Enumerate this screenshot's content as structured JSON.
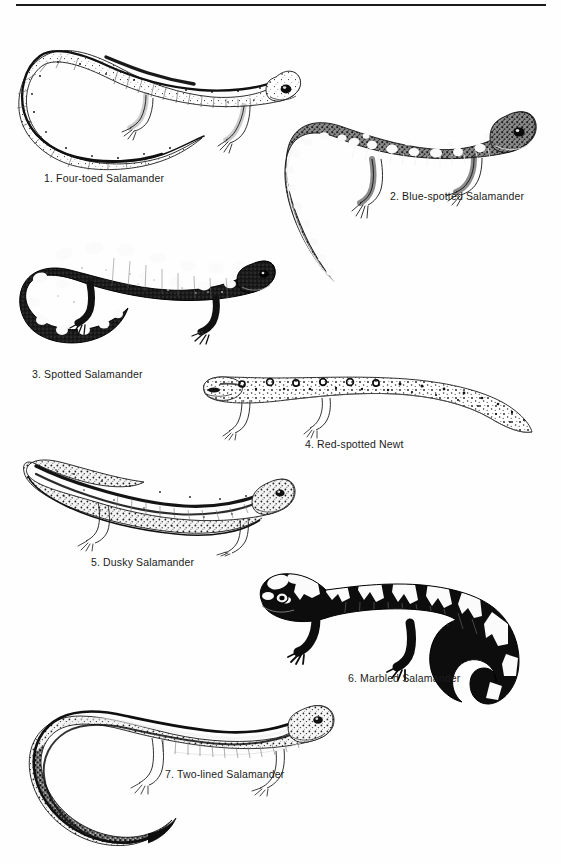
{
  "page": {
    "background_color": "#fefefe",
    "ink_color": "#1a1a1a",
    "width": 561,
    "height": 864,
    "rule": {
      "name": "top-rule",
      "color": "#1a1a1a"
    }
  },
  "plate": {
    "style": "black-and-white stipple and line engraving",
    "figures": [
      {
        "number": "1",
        "caption": "1. Four-toed Salamander",
        "common_name": "Four-toed Salamander",
        "pose": "body arched with long tail curving down and to the left, head at upper right",
        "pattern": "pale stippled body with dark dorsal stripe and scattered dark flecks",
        "tone": "light"
      },
      {
        "number": "2",
        "caption": "2. Blue-spotted Salamander",
        "common_name": "Blue-spotted Salamander",
        "pose": "head at right, body arching left then tail sweeping down and right",
        "pattern": "dark stippled body covered with large pale spots and flecks",
        "tone": "medium-dark"
      },
      {
        "number": "3",
        "caption": "3. Spotted Salamander",
        "common_name": "Spotted Salamander",
        "pose": "head at right, stout body with tail curled under to the left",
        "pattern": "solid black body with two rows of large round pale spots",
        "tone": "very dark"
      },
      {
        "number": "4",
        "caption": "4. Red-spotted Newt",
        "common_name": "Red-spotted Newt",
        "pose": "head at left, straight elongated body, tapered tail to the right",
        "pattern": "pale stippled body with a row of ringed spots along the back",
        "tone": "light"
      },
      {
        "number": "5",
        "caption": "5. Dusky Salamander",
        "common_name": "Dusky Salamander",
        "pose": "head at right, body with tail arching up and over to the left",
        "pattern": "mottled grey body with dark dorsolateral band and speckling",
        "tone": "medium"
      },
      {
        "number": "6",
        "caption": "6. Marbled Salamander",
        "common_name": "Marbled Salamander",
        "pose": "head at left, stout body arching right with tail curving down",
        "pattern": "bold black body with broad white crossbands",
        "tone": "very dark"
      },
      {
        "number": "7",
        "caption": "7. Two-lined Salamander",
        "common_name": "Two-lined Salamander",
        "pose": "head at right, slender body with long tail looping down to the left",
        "pattern": "pale back bordered by two dark lateral lines with fine speckling",
        "tone": "light"
      }
    ]
  }
}
